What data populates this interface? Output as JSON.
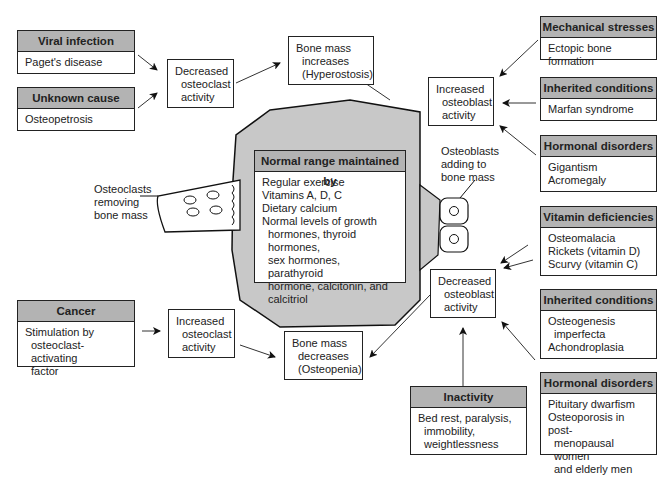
{
  "diagram": {
    "center_box": {
      "header": "Normal range maintained by",
      "lines": [
        "Regular exercise",
        "Vitamins A, D, C",
        "Dietary calcium",
        "Normal levels of growth"
      ],
      "indented_lines": [
        "hormones, thyroid hormones,",
        "sex hormones, parathyroid",
        "hormone, calcitonin, and",
        "calcitriol"
      ]
    },
    "osteoclasts_label": [
      "Osteoclasts",
      "removing",
      "bone mass"
    ],
    "osteoblasts_label": [
      "Osteoblasts",
      "adding to",
      "bone mass"
    ],
    "left_causes": [
      {
        "header": "Viral infection",
        "lines": [
          "Paget's disease"
        ]
      },
      {
        "header": "Unknown cause",
        "lines": [
          "Osteopetrosis"
        ]
      },
      {
        "header": "Cancer",
        "lines": [
          "Stimulation by",
          "osteoclast-activating",
          "factor"
        ]
      }
    ],
    "right_causes": [
      {
        "header": "Mechanical stresses",
        "lines": [
          "Ectopic bone formation"
        ]
      },
      {
        "header": "Inherited conditions",
        "lines": [
          "Marfan syndrome"
        ]
      },
      {
        "header": "Hormonal disorders",
        "lines": [
          "Gigantism",
          "Acromegaly"
        ]
      },
      {
        "header": "Vitamin deficiencies",
        "lines": [
          "Osteomalacia",
          "Rickets (vitamin D)",
          "Scurvy (vitamin C)"
        ]
      },
      {
        "header": "Inherited conditions",
        "lines": [
          "Osteogenesis",
          "imperfecta",
          "Achondroplasia"
        ]
      },
      {
        "header": "Hormonal disorders",
        "lines": [
          "Pituitary dwarfism",
          "Osteoporosis in post-",
          "menopausal women",
          "and elderly men"
        ]
      },
      {
        "header": "Inactivity",
        "lines": [
          "Bed rest, paralysis,",
          "immobility,",
          "weightlessness"
        ]
      }
    ],
    "process_boxes": {
      "decreased_osteoclast": [
        "Decreased",
        "osteoclast",
        "activity"
      ],
      "increased_osteoclast": [
        "Increased",
        "osteoclast",
        "activity"
      ],
      "increased_osteoblast": [
        "Increased",
        "osteoblast",
        "activity"
      ],
      "decreased_osteoblast": [
        "Decreased",
        "osteoblast",
        "activity"
      ]
    },
    "outcomes": {
      "increase": [
        "Bone mass",
        "increases",
        "(Hyperostosis)"
      ],
      "decrease": [
        "Bone mass",
        "decreases",
        "(Osteopenia)"
      ]
    },
    "colors": {
      "bone_fill": "#c8c8c8",
      "header_fill": "#b3b3b3",
      "line": "#222222"
    }
  }
}
